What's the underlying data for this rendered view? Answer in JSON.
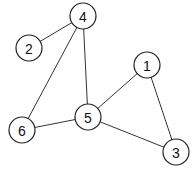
{
  "graph": {
    "nodes": [
      {
        "id": "4",
        "label": "4",
        "x": 83,
        "y": 16
      },
      {
        "id": "2",
        "label": "2",
        "x": 29,
        "y": 48
      },
      {
        "id": "1",
        "label": "1",
        "x": 147,
        "y": 65
      },
      {
        "id": "5",
        "label": "5",
        "x": 88,
        "y": 117
      },
      {
        "id": "6",
        "label": "6",
        "x": 22,
        "y": 130
      },
      {
        "id": "3",
        "label": "3",
        "x": 176,
        "y": 152
      }
    ],
    "edges": [
      [
        "4",
        "2"
      ],
      [
        "4",
        "6"
      ],
      [
        "4",
        "5"
      ],
      [
        "5",
        "6"
      ],
      [
        "5",
        "1"
      ],
      [
        "5",
        "3"
      ],
      [
        "1",
        "3"
      ]
    ],
    "node_radius": 13
  }
}
